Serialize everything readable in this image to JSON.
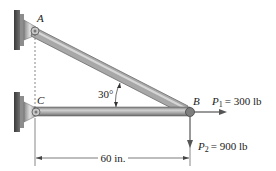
{
  "diagram": {
    "type": "two-member truss / bracket",
    "points": {
      "A": {
        "label": "A"
      },
      "B": {
        "label": "B"
      },
      "C": {
        "label": "C"
      }
    },
    "angle_label": "30°",
    "dimension": {
      "label": "60 in."
    },
    "loads": {
      "P1": {
        "symbol": "P",
        "subscript": "1",
        "value": "= 300 lb"
      },
      "P2": {
        "symbol": "P",
        "subscript": "2",
        "value": "= 900 lb"
      }
    },
    "colors": {
      "member": "#9a9a9a",
      "member_highlight": "#c8c8c8",
      "member_shadow": "#6e6e6e",
      "wall": "#4a4a4a",
      "bracket": "#b0b0b0",
      "arrow": "#555555",
      "text": "#222222"
    }
  }
}
